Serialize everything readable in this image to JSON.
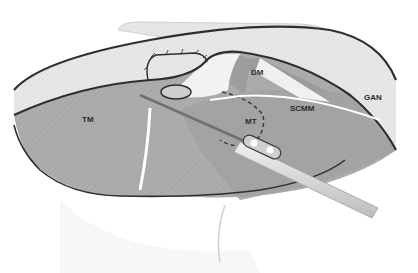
{
  "figure": {
    "labels": {
      "tm": "TM",
      "dm": "DM",
      "mt": "MT",
      "scmm": "SCMM",
      "gan": "GAN"
    },
    "colors": {
      "background": "#ffffff",
      "skin_flap": "#e6e6e6",
      "muscle": "#a8a8a8",
      "muscle_dark": "#979797",
      "outline": "#2e2e2e",
      "instrument": "#d9d9d9",
      "nerve": "#ffffff"
    }
  }
}
